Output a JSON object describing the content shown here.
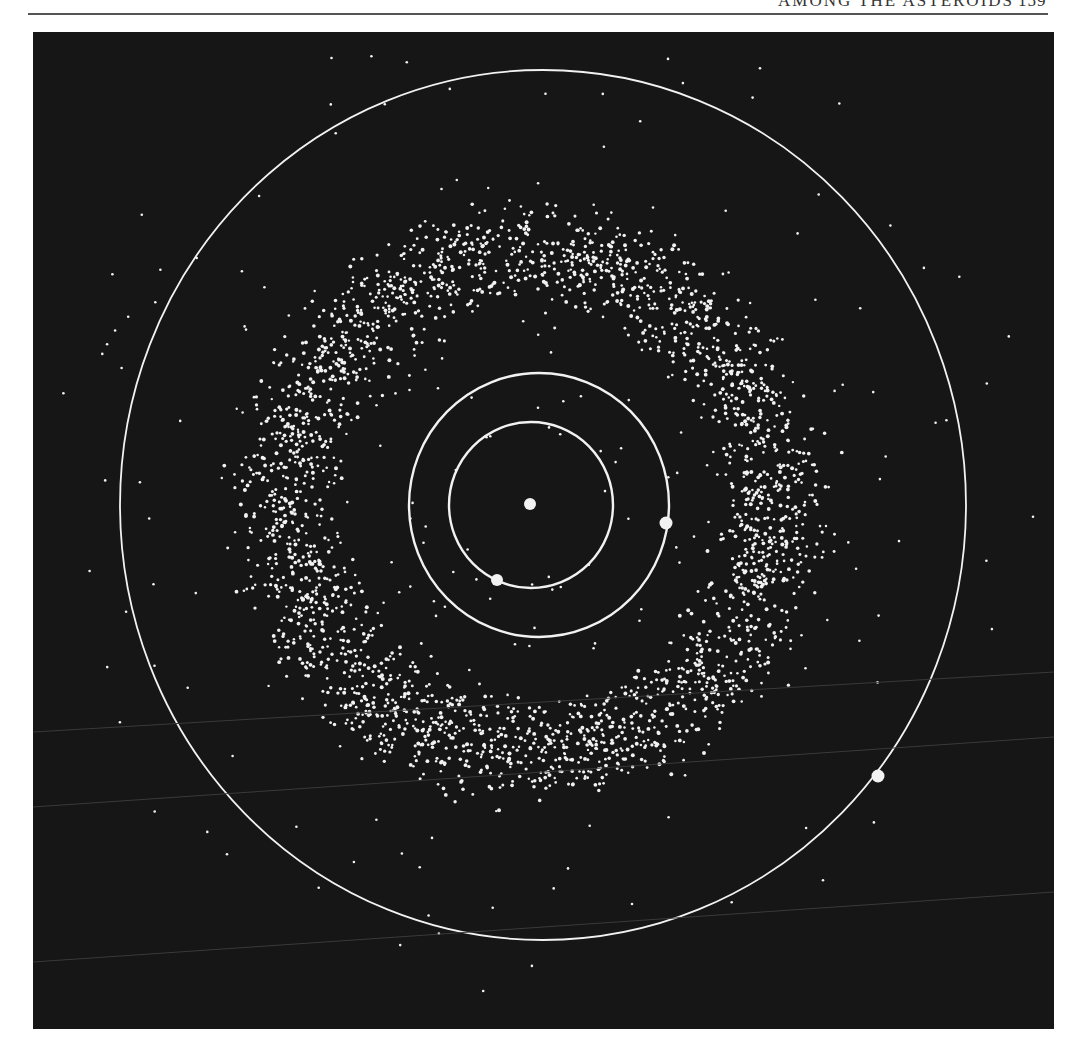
{
  "page": {
    "left_folio": "",
    "running_title": "AMONG THE ASTEROIDS",
    "page_number": "159"
  },
  "figure": {
    "background": "#161616",
    "foreground": "#f2f2f2",
    "sun": {
      "label": "Sun",
      "cx": 497,
      "cy": 472,
      "r": 6
    },
    "orbits": [
      {
        "name": "Earth orbit",
        "cx": 498,
        "cy": 473,
        "rx": 82,
        "ry": 83
      },
      {
        "name": "Mars orbit",
        "cx": 506,
        "cy": 473,
        "rx": 130,
        "ry": 132
      },
      {
        "name": "Jupiter orbit",
        "cx": 510,
        "cy": 473,
        "rx": 423,
        "ry": 435
      }
    ],
    "planets": [
      {
        "name": "Earth",
        "cx": 464,
        "cy": 548,
        "r": 6
      },
      {
        "name": "Mars",
        "cx": 633,
        "cy": 491,
        "r": 6.5
      },
      {
        "name": "Jupiter",
        "cx": 845,
        "cy": 744,
        "r": 6.5
      }
    ],
    "belt": {
      "inner_radius": 175,
      "outer_radius": 315,
      "count": 2600,
      "scatter_count": 220
    }
  }
}
